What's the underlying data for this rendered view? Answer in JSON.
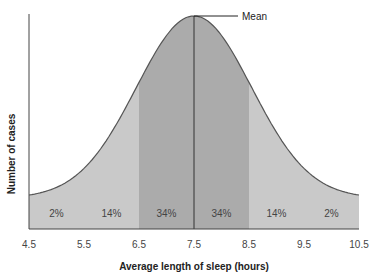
{
  "chart_data": {
    "type": "area",
    "title": "",
    "xlabel": "Average length of sleep (hours)",
    "ylabel": "Number of cases",
    "x_ticks": [
      "4.5",
      "5.5",
      "6.5",
      "7.5",
      "8.5",
      "9.5",
      "10.5"
    ],
    "xlim": [
      4.5,
      10.5
    ],
    "distribution": "normal",
    "mean": 7.5,
    "std_dev": 1,
    "annotation": "Mean",
    "regions": [
      {
        "from": 4.5,
        "to": 5.5,
        "label": "2%",
        "color": "#c9c9c9"
      },
      {
        "from": 5.5,
        "to": 6.5,
        "label": "14%",
        "color": "#c9c9c9"
      },
      {
        "from": 6.5,
        "to": 7.5,
        "label": "34%",
        "color": "#ababab"
      },
      {
        "from": 7.5,
        "to": 8.5,
        "label": "34%",
        "color": "#ababab"
      },
      {
        "from": 8.5,
        "to": 9.5,
        "label": "14%",
        "color": "#c9c9c9"
      },
      {
        "from": 9.5,
        "to": 10.5,
        "label": "2%",
        "color": "#c9c9c9"
      }
    ],
    "grid": false,
    "legend": "none"
  },
  "labels": {
    "xlabel": "Average length of sleep (hours)",
    "ylabel": "Number of cases",
    "mean": "Mean"
  }
}
